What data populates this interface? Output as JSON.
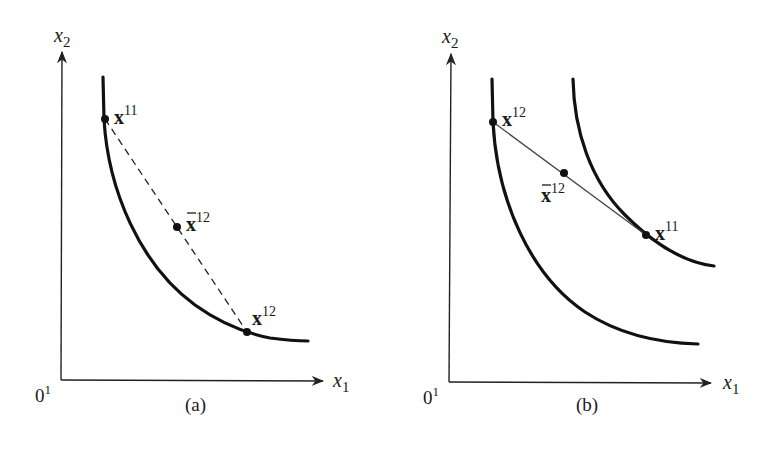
{
  "figure": {
    "panels": [
      {
        "id": "a",
        "caption": "(a)",
        "origin_label": "0",
        "origin_sup": "1",
        "x_axis_label": "x",
        "x_axis_sub": "1",
        "y_axis_label": "x",
        "y_axis_sub": "2",
        "curves": 1,
        "chord_style": "dashed",
        "points": [
          {
            "name": "x",
            "sup": "11",
            "bar": false,
            "desc": "endpoint on indifference curve (upper-left)"
          },
          {
            "name": "x",
            "sup": "12",
            "bar": true,
            "desc": "midpoint of chord"
          },
          {
            "name": "x",
            "sup": "12",
            "bar": false,
            "desc": "endpoint on indifference curve (lower-right)"
          }
        ]
      },
      {
        "id": "b",
        "caption": "(b)",
        "origin_label": "0",
        "origin_sup": "1",
        "x_axis_label": "x",
        "x_axis_sub": "1",
        "y_axis_label": "x",
        "y_axis_sub": "2",
        "curves": 2,
        "chord_style": "solid",
        "points": [
          {
            "name": "x",
            "sup": "12",
            "bar": false,
            "desc": "endpoint on lower indifference curve"
          },
          {
            "name": "x",
            "sup": "12",
            "bar": true,
            "desc": "midpoint of chord"
          },
          {
            "name": "x",
            "sup": "11",
            "bar": false,
            "desc": "endpoint on higher indifference curve"
          }
        ]
      }
    ]
  },
  "colors": {
    "ink": "#111111",
    "background": "#ffffff"
  }
}
